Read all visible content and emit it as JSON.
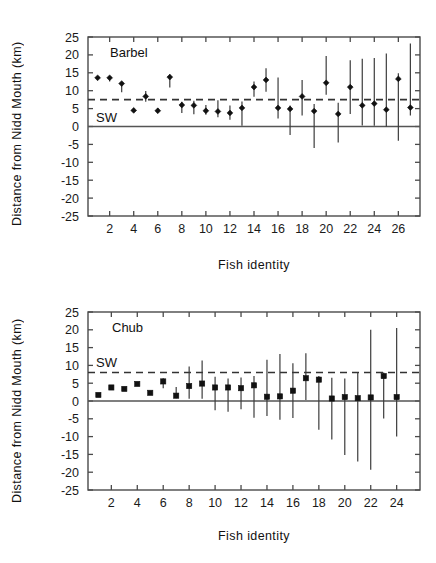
{
  "figure": {
    "background": "#ffffff",
    "ink": "#1a1a1a"
  },
  "panels": [
    {
      "id": "barbel",
      "series_label": "Barbel",
      "reference_label": "SW",
      "ylabel": "Distance from Nidd Mouth (km)",
      "xlabel": "Fish identity"
    },
    {
      "id": "chub",
      "series_label": "Chub",
      "reference_label": "SW",
      "ylabel": "Distance from Nidd Mouth (km)",
      "xlabel": "Fish identity"
    }
  ],
  "chart_data": [
    {
      "type": "scatter",
      "id": "barbel",
      "title": "Barbel",
      "xlabel": "Fish identity",
      "ylabel": "Distance from Nidd Mouth (km)",
      "ylim": [
        -25,
        25
      ],
      "yticks": [
        25,
        20,
        15,
        10,
        5,
        0,
        -5,
        -10,
        -15,
        -20,
        -25
      ],
      "xlim": [
        0.2,
        27.8
      ],
      "xticks": [
        2,
        4,
        6,
        8,
        10,
        12,
        14,
        16,
        18,
        20,
        22,
        24,
        26
      ],
      "grid": false,
      "legend": "none",
      "marker": "diamond",
      "reference_line": {
        "label": "SW",
        "value": 7.5,
        "style": "dashed",
        "color": "#333333"
      },
      "zero_line": {
        "value": 0,
        "style": "solid",
        "color": "#555555"
      },
      "x": [
        1,
        2,
        3,
        4,
        5,
        6,
        7,
        8,
        9,
        10,
        11,
        12,
        13,
        14,
        15,
        16,
        17,
        18,
        19,
        20,
        21,
        22,
        23,
        24,
        25,
        26,
        27
      ],
      "values": [
        13.6,
        13.6,
        12.0,
        4.5,
        8.4,
        4.4,
        13.8,
        6.0,
        5.9,
        4.4,
        4.2,
        3.8,
        5.2,
        11.0,
        13.0,
        5.2,
        4.9,
        8.4,
        4.3,
        12.2,
        3.5,
        11.0,
        5.9,
        6.4,
        4.7,
        13.3,
        5.3
      ],
      "err_low": [
        13.6,
        12.6,
        9.6,
        4.5,
        6.9,
        4.4,
        10.9,
        3.8,
        3.4,
        3.3,
        2.6,
        1.9,
        0.2,
        8.3,
        9.7,
        2.2,
        -2.4,
        3.1,
        -6.0,
        8.9,
        -4.5,
        3.5,
        0.3,
        0.2,
        -0.1,
        -4.0,
        3.1
      ],
      "err_high": [
        13.6,
        13.6,
        12.0,
        5.1,
        9.9,
        5.2,
        14.6,
        6.9,
        7.2,
        6.0,
        7.3,
        5.9,
        7.0,
        12.6,
        16.3,
        13.7,
        5.9,
        13.0,
        6.3,
        19.7,
        6.6,
        18.5,
        18.9,
        19.1,
        20.4,
        14.9,
        23.2
      ]
    },
    {
      "type": "scatter",
      "id": "chub",
      "title": "Chub",
      "xlabel": "Fish identity",
      "ylabel": "Distance from Nidd Mouth (km)",
      "ylim": [
        -25,
        25
      ],
      "yticks": [
        25,
        20,
        15,
        10,
        5,
        0,
        -5,
        -10,
        -15,
        -20,
        -25
      ],
      "xlim": [
        0.2,
        25.8
      ],
      "xticks": [
        2,
        4,
        6,
        8,
        10,
        12,
        14,
        16,
        18,
        20,
        22,
        24
      ],
      "grid": false,
      "legend": "none",
      "marker": "square",
      "reference_line": {
        "label": "SW",
        "value": 8.0,
        "style": "dashed",
        "color": "#333333"
      },
      "zero_line": {
        "value": 0,
        "style": "solid",
        "color": "#555555"
      },
      "x": [
        1,
        2,
        3,
        4,
        5,
        6,
        7,
        8,
        9,
        10,
        11,
        12,
        13,
        14,
        15,
        16,
        17,
        18,
        19,
        20,
        21,
        22,
        23,
        24
      ],
      "values": [
        1.7,
        3.8,
        3.4,
        4.8,
        2.3,
        5.5,
        1.5,
        4.2,
        4.9,
        3.8,
        3.8,
        3.6,
        4.4,
        1.2,
        1.3,
        2.9,
        6.4,
        6.0,
        0.7,
        1.1,
        0.8,
        1.0,
        7.0,
        1.1
      ],
      "err_low": [
        1.7,
        3.8,
        3.4,
        4.8,
        2.3,
        3.6,
        0.8,
        0.6,
        0.6,
        -2.6,
        -3.0,
        -2.3,
        -4.7,
        -4.2,
        -5.3,
        -4.8,
        0.3,
        -8.1,
        -10.8,
        -15.2,
        -17.0,
        -19.3,
        -4.9,
        -10.0
      ],
      "err_high": [
        1.7,
        3.8,
        3.4,
        4.8,
        2.3,
        6.4,
        3.9,
        9.7,
        11.4,
        6.8,
        6.3,
        6.6,
        7.0,
        11.6,
        13.2,
        10.6,
        13.4,
        7.0,
        6.5,
        6.3,
        8.0,
        20.0,
        8.0,
        20.5
      ]
    }
  ]
}
